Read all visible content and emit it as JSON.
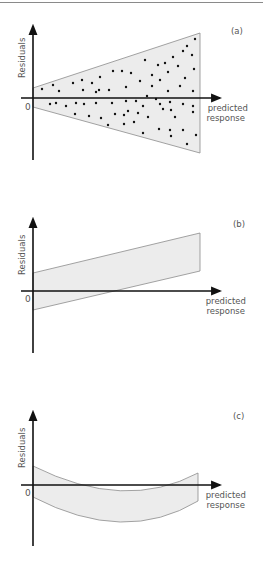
{
  "colors": {
    "axis": "#111111",
    "band_fill": "#ececec",
    "band_stroke": "#8c8c8c",
    "dot": "#111111",
    "text": "#555555"
  },
  "chart_data": [
    {
      "type": "scatter",
      "panel_label": "(a)",
      "title": "",
      "xlabel": "predicted response",
      "ylabel": "Residuals",
      "origin_label": "0",
      "pattern": "funnel (increasing variance)",
      "band": {
        "left_top": 10,
        "left_bottom": -9,
        "right_top": 65,
        "right_bottom": -55
      },
      "points": [
        [
          42,
          89
        ],
        [
          53,
          85
        ],
        [
          59,
          91
        ],
        [
          73,
          83
        ],
        [
          82,
          80
        ],
        [
          92,
          83
        ],
        [
          100,
          77
        ],
        [
          113,
          71
        ],
        [
          122,
          71
        ],
        [
          131,
          73
        ],
        [
          145,
          60
        ],
        [
          152,
          75
        ],
        [
          140,
          81
        ],
        [
          126,
          87
        ],
        [
          109,
          90
        ],
        [
          99,
          90
        ],
        [
          83,
          90
        ],
        [
          96,
          92
        ],
        [
          50,
          104
        ],
        [
          56,
          103
        ],
        [
          66,
          106
        ],
        [
          76,
          103
        ],
        [
          84,
          104
        ],
        [
          96,
          103
        ],
        [
          112,
          103
        ],
        [
          126,
          101
        ],
        [
          136,
          101
        ],
        [
          143,
          106
        ],
        [
          160,
          104
        ],
        [
          170,
          102
        ],
        [
          183,
          104
        ],
        [
          193,
          106
        ],
        [
          75,
          114
        ],
        [
          89,
          116
        ],
        [
          101,
          118
        ],
        [
          115,
          114
        ],
        [
          124,
          115
        ],
        [
          128,
          111
        ],
        [
          138,
          113
        ],
        [
          148,
          117
        ],
        [
          163,
          109
        ],
        [
          171,
          110
        ],
        [
          175,
          117
        ],
        [
          193,
          112
        ],
        [
          108,
          125
        ],
        [
          124,
          124
        ],
        [
          134,
          122
        ],
        [
          143,
          133
        ],
        [
          159,
          129
        ],
        [
          170,
          130
        ],
        [
          171,
          136
        ],
        [
          183,
          130
        ],
        [
          187,
          144
        ],
        [
          196,
          135
        ],
        [
          158,
          65
        ],
        [
          165,
          63
        ],
        [
          173,
          57
        ],
        [
          183,
          51
        ],
        [
          192,
          55
        ],
        [
          195,
          39
        ],
        [
          187,
          46
        ],
        [
          178,
          66
        ],
        [
          168,
          72
        ],
        [
          160,
          80
        ],
        [
          152,
          86
        ],
        [
          185,
          78
        ],
        [
          194,
          69
        ],
        [
          193,
          91
        ],
        [
          180,
          86
        ],
        [
          168,
          91
        ],
        [
          147,
          96
        ],
        [
          156,
          99
        ]
      ],
      "xlim": [
        0,
        1
      ],
      "ylim": [
        -1,
        1
      ]
    },
    {
      "type": "area",
      "panel_label": "(b)",
      "title": "",
      "xlabel": "predicted response",
      "ylabel": "Residuals",
      "origin_label": "0",
      "pattern": "linear trend (band slopes upward)",
      "band": {
        "left_top": 18,
        "left_bottom": -19,
        "right_top": 58,
        "right_bottom": 20
      },
      "xlim": [
        0,
        1
      ],
      "ylim": [
        -1,
        1
      ]
    },
    {
      "type": "area",
      "panel_label": "(c)",
      "title": "",
      "xlabel": "predicted response",
      "ylabel": "Residuals",
      "origin_label": "0",
      "pattern": "curvilinear (U-shaped band)",
      "band": {
        "left_top": 19,
        "left_bottom": -12,
        "middle_top": -5,
        "middle_bottom": -34,
        "right_top": 12,
        "right_bottom": -16
      },
      "xlim": [
        0,
        1
      ],
      "ylim": [
        -1,
        1
      ]
    }
  ]
}
